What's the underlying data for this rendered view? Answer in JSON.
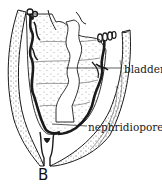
{
  "figure": {
    "panel_letter": "B",
    "labels": {
      "bladder": "bladder",
      "nephridiopore": "nephridiopore"
    },
    "colors": {
      "ink": "#1a1a1a",
      "background": "#ffffff"
    }
  }
}
